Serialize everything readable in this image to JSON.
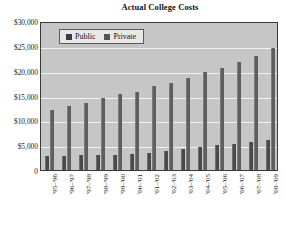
{
  "chart_data": {
    "type": "bar",
    "title": "Actual College Costs",
    "xlabel": "",
    "ylabel": "",
    "ylim": [
      0,
      30000
    ],
    "ytick_labels": [
      "$30,000",
      "$25,000",
      "$20,000",
      "$15,000",
      "$10,000",
      "$5,000",
      "0"
    ],
    "ytick_values": [
      30000,
      25000,
      20000,
      15000,
      10000,
      5000,
      0
    ],
    "grid": true,
    "legend_position": "upper-left-inside",
    "categories": [
      "'95–'96",
      "'96–'97",
      "'97–'98",
      "'98–'99",
      "'99–'00",
      "'00–'01",
      "'01–'02",
      "'02–'03",
      "'03–'04",
      "'04–'05",
      "'05–'06",
      "'06–'07",
      "'07–'08",
      "'08–'09"
    ],
    "series": [
      {
        "name": "Public",
        "color": "#4a4a4a",
        "values": [
          2850,
          2900,
          2950,
          3000,
          3100,
          3200,
          3500,
          3750,
          4150,
          4700,
          5050,
          5300,
          5650,
          6000
        ]
      },
      {
        "name": "Private",
        "color": "#5e5e5e",
        "values": [
          12050,
          12800,
          13550,
          14450,
          15250,
          15800,
          16950,
          17550,
          18500,
          19700,
          20450,
          21800,
          23000,
          24500
        ]
      }
    ]
  },
  "legend": {
    "items": [
      {
        "label": "Public",
        "swatch": "public-swatch"
      },
      {
        "label": "Private",
        "swatch": "private-swatch"
      }
    ]
  },
  "colors": {
    "plot_background": "#c6c6c6",
    "gridline": "#f2f2f2",
    "public_bar": "#4a4a4a",
    "private_bar": "#5e5e5e",
    "axis": "#3a3a3a",
    "page_background": "#ffffff"
  }
}
